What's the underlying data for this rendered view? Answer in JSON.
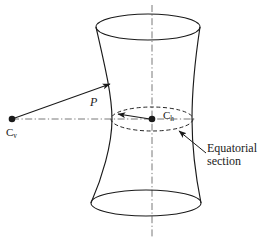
{
  "figure": {
    "background": "#ffffff",
    "stroke": "#1a1a1a",
    "width": 275,
    "height": 240
  },
  "labels": {
    "viewpoint": {
      "base": "C",
      "subscript": "v",
      "x": 6,
      "y": 126
    },
    "center": {
      "base": "C",
      "subscript": "h",
      "x": 163,
      "y": 109
    },
    "point_p": {
      "text": "P",
      "x": 90,
      "y": 96
    },
    "equatorial_section": {
      "line1": "Equatorial",
      "line2": "section",
      "x": 207,
      "y": 142
    }
  },
  "geometry": {
    "axis_vertical": {
      "x": 152,
      "y1": 5,
      "y2": 238,
      "style": "dash-dot"
    },
    "axis_horizontal": {
      "y": 119,
      "x1": 12,
      "x2": 196,
      "style": "dash-dot"
    },
    "top_ellipse": {
      "cx": 148,
      "cy": 27,
      "rx": 52,
      "ry": 13,
      "style": "solid"
    },
    "bottom_ellipse": {
      "cx": 146,
      "cy": 203,
      "rx": 55,
      "ry": 13,
      "style": "solid"
    },
    "equatorial_ellipse": {
      "cx": 152,
      "cy": 119,
      "rx": 41,
      "ry": 12,
      "style": "dashed"
    },
    "waist_left": {
      "top_x": 96,
      "waist_x": 112,
      "bottom_x": 91
    },
    "waist_right": {
      "top_x": 200,
      "waist_x": 192,
      "bottom_x": 201
    },
    "dot_viewpoint": {
      "cx": 12,
      "cy": 119,
      "r": 3.2
    },
    "dot_center": {
      "cx": 152,
      "cy": 119,
      "r": 3.2
    },
    "ray_to_surface": {
      "x1": 12,
      "y1": 119,
      "x2": 110,
      "y2": 84
    },
    "radius_arrow": {
      "x1": 150,
      "y1": 119,
      "x2": 116,
      "y2": 114
    },
    "leader_line": {
      "x1": 206,
      "y1": 153,
      "x2": 178,
      "y2": 130
    }
  }
}
